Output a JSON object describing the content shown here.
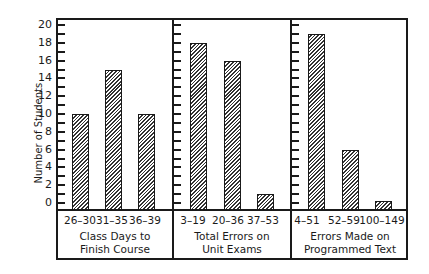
{
  "chart_data": {
    "type": "bar",
    "ylabel": "Number of Students",
    "ylim": [
      0,
      20
    ],
    "yticks": [
      0,
      2,
      4,
      6,
      8,
      10,
      12,
      14,
      16,
      18,
      20
    ],
    "grid": false,
    "panels": [
      {
        "title_line1": "Class Days to",
        "title_line2": "Finish Course",
        "categories": [
          "26–30",
          "31–35",
          "36–39"
        ],
        "values": [
          10,
          15,
          10
        ]
      },
      {
        "title_line1": "Total Errors on",
        "title_line2": "Unit Exams",
        "categories": [
          "3–19",
          "20–36",
          "37–53"
        ],
        "values": [
          18,
          16,
          1
        ]
      },
      {
        "title_line1": "Errors Made on",
        "title_line2": "Programmed Text",
        "categories": [
          "4–51",
          "52–59",
          "100–149"
        ],
        "values": [
          19,
          6,
          0.2
        ]
      }
    ]
  }
}
